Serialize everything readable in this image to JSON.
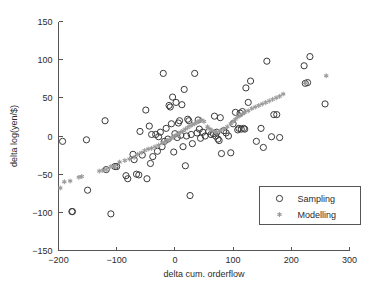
{
  "chart_data": {
    "type": "scatter",
    "title": "",
    "xlabel": "delta cum. orderflow",
    "ylabel": "delta log(yen/$)",
    "xlim": [
      -200,
      300
    ],
    "ylim": [
      -150,
      150
    ],
    "xticks": [
      -200,
      -100,
      0,
      100,
      200,
      300
    ],
    "yticks": [
      -150,
      -100,
      -50,
      0,
      50,
      100,
      150
    ],
    "xtick_labels": [
      "-200",
      "-100",
      "0",
      "100",
      "200",
      "300"
    ],
    "ytick_labels": [
      "-150",
      "-100",
      "-50",
      "0",
      "50",
      "100",
      "150"
    ],
    "grid": false,
    "legend_position": "lower-right",
    "series": [
      {
        "name": "Sampling",
        "marker": "open-circle",
        "color": "#3a3a3a",
        "points": [
          [
            -193,
            -7
          ],
          [
            -177,
            -99
          ],
          [
            -176,
            -99
          ],
          [
            -152,
            -5
          ],
          [
            -150,
            -71
          ],
          [
            -120,
            20
          ],
          [
            -118,
            -44
          ],
          [
            -110,
            -102
          ],
          [
            -103,
            -40
          ],
          [
            -100,
            -40
          ],
          [
            -84,
            -52
          ],
          [
            -81,
            -56
          ],
          [
            -72,
            -24
          ],
          [
            -70,
            -31
          ],
          [
            -66,
            -50
          ],
          [
            -62,
            -51
          ],
          [
            -60,
            6
          ],
          [
            -56,
            -25
          ],
          [
            -50,
            34
          ],
          [
            -48,
            -56
          ],
          [
            -44,
            13
          ],
          [
            -42,
            -36
          ],
          [
            -40,
            2
          ],
          [
            -38,
            -27
          ],
          [
            -33,
            2
          ],
          [
            -30,
            -20
          ],
          [
            -28,
            -1
          ],
          [
            -25,
            5
          ],
          [
            -22,
            -14
          ],
          [
            -20,
            82
          ],
          [
            -18,
            -7
          ],
          [
            -15,
            10
          ],
          [
            -12,
            -4
          ],
          [
            -10,
            40
          ],
          [
            -8,
            38
          ],
          [
            -6,
            16
          ],
          [
            -4,
            51
          ],
          [
            -2,
            -21
          ],
          [
            0,
            3
          ],
          [
            2,
            44
          ],
          [
            4,
            -2
          ],
          [
            6,
            17
          ],
          [
            8,
            20
          ],
          [
            10,
            1
          ],
          [
            12,
            41
          ],
          [
            14,
            -14
          ],
          [
            16,
            61
          ],
          [
            18,
            -39
          ],
          [
            20,
            0
          ],
          [
            22,
            22
          ],
          [
            24,
            20
          ],
          [
            26,
            -78
          ],
          [
            28,
            2
          ],
          [
            30,
            -10
          ],
          [
            34,
            82
          ],
          [
            38,
            4
          ],
          [
            40,
            21
          ],
          [
            42,
            9
          ],
          [
            44,
            -3
          ],
          [
            48,
            5
          ],
          [
            52,
            0
          ],
          [
            58,
            6
          ],
          [
            62,
            2
          ],
          [
            66,
            3
          ],
          [
            68,
            26
          ],
          [
            70,
            0
          ],
          [
            72,
            5
          ],
          [
            74,
            -4
          ],
          [
            76,
            -6
          ],
          [
            78,
            24
          ],
          [
            80,
            -23
          ],
          [
            84,
            7
          ],
          [
            88,
            4
          ],
          [
            92,
            0
          ],
          [
            96,
            -22
          ],
          [
            100,
            16
          ],
          [
            104,
            31
          ],
          [
            108,
            8
          ],
          [
            110,
            10
          ],
          [
            112,
            30
          ],
          [
            114,
            9
          ],
          [
            116,
            32
          ],
          [
            118,
            10
          ],
          [
            120,
            9
          ],
          [
            122,
            63
          ],
          [
            126,
            44
          ],
          [
            130,
            72
          ],
          [
            140,
            -7
          ],
          [
            148,
            10
          ],
          [
            152,
            -15
          ],
          [
            158,
            98
          ],
          [
            166,
            -1
          ],
          [
            170,
            28
          ],
          [
            175,
            28
          ],
          [
            180,
            -2
          ],
          [
            222,
            92
          ],
          [
            224,
            69
          ],
          [
            228,
            70
          ],
          [
            232,
            104
          ],
          [
            258,
            42
          ]
        ]
      },
      {
        "name": "Modelling",
        "marker": "asterisk",
        "color": "#9a9a9a",
        "points": [
          [
            -197,
            -68
          ],
          [
            -190,
            -60
          ],
          [
            -180,
            -59
          ],
          [
            -165,
            -54
          ],
          [
            -160,
            -53
          ],
          [
            -130,
            -46
          ],
          [
            -124,
            -45
          ],
          [
            -118,
            -44
          ],
          [
            -110,
            -40
          ],
          [
            -103,
            -40
          ],
          [
            -95,
            -34
          ],
          [
            -86,
            -32
          ],
          [
            -78,
            -30
          ],
          [
            -70,
            -28
          ],
          [
            -64,
            -24
          ],
          [
            -58,
            -22
          ],
          [
            -52,
            -19
          ],
          [
            -46,
            -17
          ],
          [
            -40,
            -16
          ],
          [
            -34,
            -14
          ],
          [
            -28,
            -12
          ],
          [
            -22,
            -9
          ],
          [
            -18,
            -8
          ],
          [
            -14,
            -6
          ],
          [
            -10,
            -5
          ],
          [
            -6,
            -3
          ],
          [
            -2,
            -1
          ],
          [
            2,
            1
          ],
          [
            6,
            3
          ],
          [
            10,
            5
          ],
          [
            14,
            7
          ],
          [
            18,
            9
          ],
          [
            22,
            11
          ],
          [
            26,
            13
          ],
          [
            30,
            15
          ],
          [
            34,
            16
          ],
          [
            38,
            18
          ],
          [
            42,
            20
          ],
          [
            46,
            21
          ],
          [
            50,
            19
          ],
          [
            56,
            12
          ],
          [
            60,
            9
          ],
          [
            64,
            7
          ],
          [
            68,
            6
          ],
          [
            72,
            5
          ],
          [
            78,
            7
          ],
          [
            84,
            9
          ],
          [
            90,
            12
          ],
          [
            96,
            16
          ],
          [
            100,
            19
          ],
          [
            104,
            22
          ],
          [
            108,
            25
          ],
          [
            112,
            27
          ],
          [
            116,
            29
          ],
          [
            120,
            31
          ],
          [
            126,
            33
          ],
          [
            132,
            36
          ],
          [
            138,
            38
          ],
          [
            144,
            40
          ],
          [
            150,
            42
          ],
          [
            156,
            44
          ],
          [
            162,
            46
          ],
          [
            168,
            48
          ],
          [
            174,
            50
          ],
          [
            180,
            52
          ],
          [
            186,
            55
          ],
          [
            224,
            70
          ],
          [
            260,
            79
          ]
        ]
      }
    ]
  },
  "legend": {
    "entries": [
      {
        "label": "Sampling",
        "marker": "open-circle"
      },
      {
        "label": "Modelling",
        "marker": "asterisk"
      }
    ]
  },
  "colors": {
    "sampling": "#3a3a3a",
    "modelling": "#9a9a9a",
    "axis": "#555555",
    "text": "#2b2b2b",
    "background": "#ffffff"
  }
}
